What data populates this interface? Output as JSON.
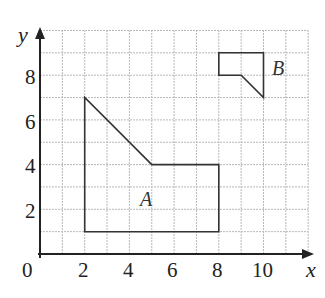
{
  "diagram": {
    "type": "coordinate-grid",
    "axes": {
      "x_label": "x",
      "y_label": "y",
      "origin_label": "0",
      "x_ticks": [
        "2",
        "4",
        "6",
        "8",
        "10"
      ],
      "y_ticks": [
        "2",
        "4",
        "6",
        "8"
      ],
      "x_range": [
        0,
        12
      ],
      "y_range": [
        0,
        10
      ],
      "grid": true
    },
    "shapes": [
      {
        "label": "A",
        "vertices": [
          [
            2,
            1
          ],
          [
            2,
            7
          ],
          [
            5,
            4
          ],
          [
            8,
            4
          ],
          [
            8,
            1
          ]
        ]
      },
      {
        "label": "B",
        "vertices": [
          [
            8,
            9
          ],
          [
            10,
            9
          ],
          [
            10,
            7
          ],
          [
            9,
            8
          ],
          [
            8,
            8
          ]
        ]
      }
    ]
  }
}
